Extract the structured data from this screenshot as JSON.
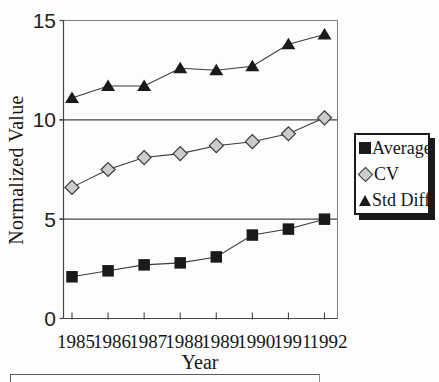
{
  "chart_data": {
    "type": "line",
    "title": "",
    "xlabel": "Year",
    "ylabel": "Normalized Value",
    "x": [
      "1985",
      "1986",
      "1987",
      "1988",
      "1989",
      "1990",
      "1991",
      "1992"
    ],
    "ylim": [
      0,
      15
    ],
    "y_ticks": [
      0,
      5,
      10,
      15
    ],
    "gridlines": [
      5,
      10
    ],
    "grid": "horizontal-only",
    "legend_position": "right-outside-shadowed-box",
    "series": [
      {
        "name": "Average",
        "marker": "square",
        "marker_color": "#1a1a1a",
        "line_color": "#3a3a3a",
        "values": [
          2.1,
          2.4,
          2.7,
          2.8,
          3.1,
          4.2,
          4.5,
          5.0
        ]
      },
      {
        "name": "CV",
        "marker": "diamond",
        "marker_color": "#cccccc",
        "marker_stroke": "#3a3a3a",
        "line_color": "#3a3a3a",
        "values": [
          6.6,
          7.5,
          8.1,
          8.3,
          8.7,
          8.9,
          9.3,
          10.1
        ]
      },
      {
        "name": "Std Diff",
        "marker": "triangle",
        "marker_color": "#1a1a1a",
        "line_color": "#3a3a3a",
        "values": [
          11.1,
          11.7,
          11.7,
          12.6,
          12.5,
          12.7,
          13.8,
          14.3
        ]
      }
    ]
  }
}
